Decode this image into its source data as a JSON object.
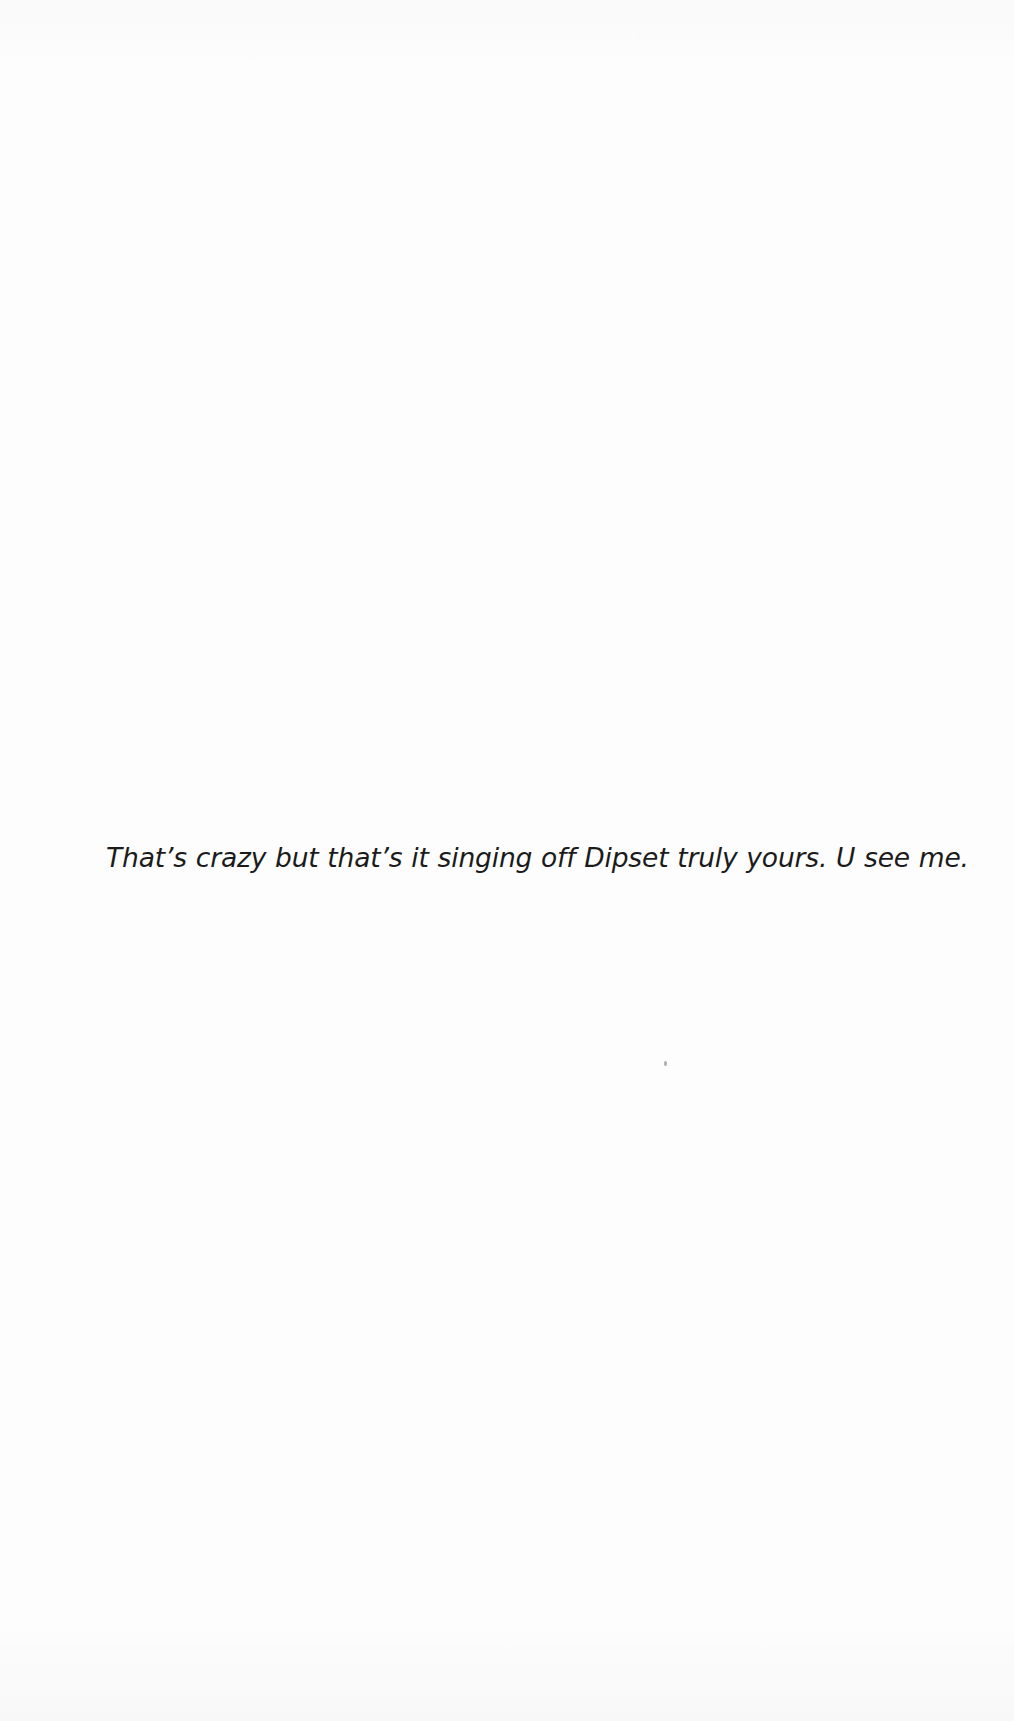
{
  "page": {
    "background_color": "#fdfdfd",
    "ink_color": "#1b1b1b",
    "width": 1014,
    "height": 1721
  },
  "body": {
    "lines": [
      {
        "text": "That’s crazy but that’s it singing off Dipset truly yours. U see me."
      }
    ]
  },
  "artifacts": {
    "speck": {
      "label": "scan-speck",
      "color": "#9a9a9a"
    }
  }
}
